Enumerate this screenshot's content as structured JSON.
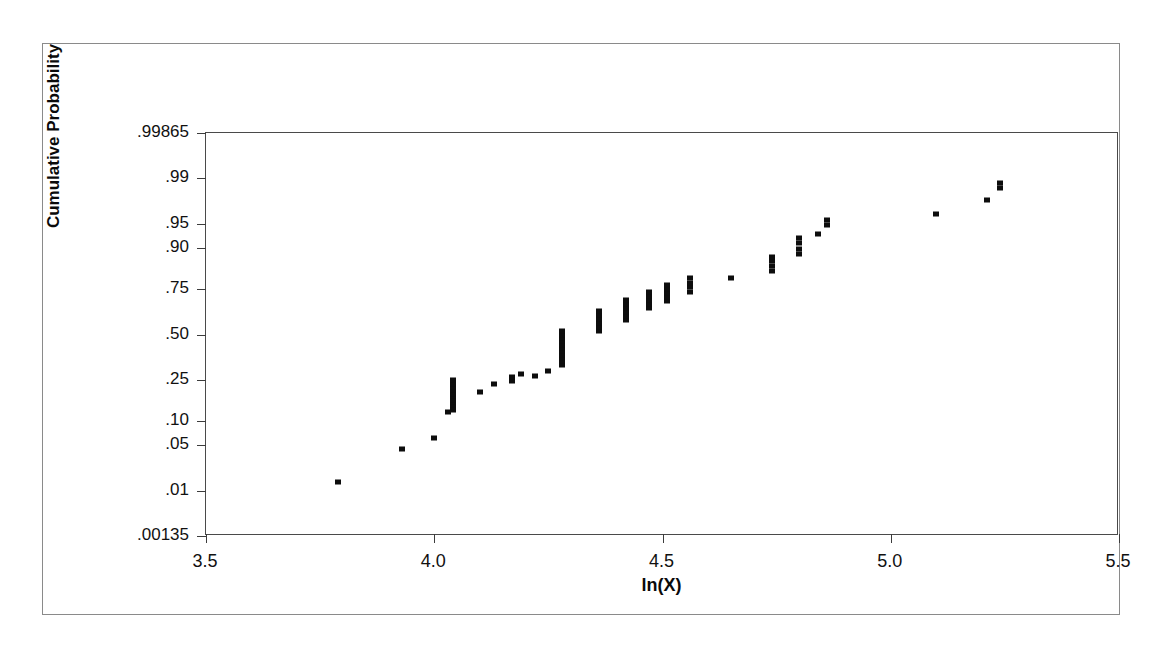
{
  "chart_data": {
    "type": "scatter",
    "title": "",
    "subtitle": "",
    "xlabel": "ln(X)",
    "ylabel": "Cumulative Probability",
    "plot_kind": "normal-probability-plot",
    "grid": false,
    "legend": null,
    "xlim": [
      3.5,
      5.5
    ],
    "xticks": [
      "3.5",
      "4.0",
      "4.5",
      "5.0",
      "5.5"
    ],
    "xtick_values": [
      3.5,
      4.0,
      4.5,
      5.0,
      5.5
    ],
    "ylim_probability": [
      0.00135,
      0.99865
    ],
    "ylim_z": [
      -3,
      3
    ],
    "yticks": [
      ".99865",
      ".99",
      ".95",
      ".90",
      ".75",
      ".50",
      ".25",
      ".10",
      ".05",
      ".01",
      ".00135"
    ],
    "ytick_values": [
      0.99865,
      0.99,
      0.95,
      0.9,
      0.75,
      0.5,
      0.25,
      0.1,
      0.05,
      0.01,
      0.00135
    ],
    "ytick_z": [
      3.0,
      2.326,
      1.645,
      1.282,
      0.674,
      0.0,
      -0.674,
      -1.282,
      -1.645,
      -2.326,
      -3.0
    ],
    "marker": "square",
    "marker_color": "#0d0d0d",
    "point_count": 78,
    "points_xz": [
      [
        3.79,
        -2.19
      ],
      [
        3.93,
        -1.7
      ],
      [
        4.0,
        -1.54
      ],
      [
        4.03,
        -1.16
      ],
      [
        4.04,
        -1.13
      ],
      [
        4.04,
        -1.09
      ],
      [
        4.04,
        -1.05
      ],
      [
        4.04,
        -1.01
      ],
      [
        4.04,
        -0.97
      ],
      [
        4.04,
        -0.92
      ],
      [
        4.04,
        -0.88
      ],
      [
        4.04,
        -0.83
      ],
      [
        4.04,
        -0.78
      ],
      [
        4.04,
        -0.73
      ],
      [
        4.04,
        -0.68
      ],
      [
        4.1,
        -0.85
      ],
      [
        4.13,
        -0.74
      ],
      [
        4.17,
        -0.69
      ],
      [
        4.17,
        -0.64
      ],
      [
        4.19,
        -0.59
      ],
      [
        4.22,
        -0.62
      ],
      [
        4.25,
        -0.55
      ],
      [
        4.28,
        -0.45
      ],
      [
        4.28,
        -0.4
      ],
      [
        4.28,
        -0.35
      ],
      [
        4.28,
        -0.3
      ],
      [
        4.28,
        -0.25
      ],
      [
        4.28,
        -0.2
      ],
      [
        4.28,
        -0.15
      ],
      [
        4.28,
        -0.1
      ],
      [
        4.28,
        -0.05
      ],
      [
        4.28,
        0.0
      ],
      [
        4.28,
        0.05
      ],
      [
        4.36,
        0.05
      ],
      [
        4.36,
        0.11
      ],
      [
        4.36,
        0.17
      ],
      [
        4.36,
        0.23
      ],
      [
        4.36,
        0.29
      ],
      [
        4.36,
        0.35
      ],
      [
        4.42,
        0.22
      ],
      [
        4.42,
        0.28
      ],
      [
        4.42,
        0.34
      ],
      [
        4.42,
        0.4
      ],
      [
        4.42,
        0.46
      ],
      [
        4.42,
        0.52
      ],
      [
        4.47,
        0.4
      ],
      [
        4.47,
        0.46
      ],
      [
        4.47,
        0.52
      ],
      [
        4.47,
        0.58
      ],
      [
        4.47,
        0.64
      ],
      [
        4.51,
        0.5
      ],
      [
        4.51,
        0.56
      ],
      [
        4.51,
        0.62
      ],
      [
        4.51,
        0.68
      ],
      [
        4.51,
        0.74
      ],
      [
        4.56,
        0.63
      ],
      [
        4.56,
        0.7
      ],
      [
        4.56,
        0.77
      ],
      [
        4.56,
        0.84
      ],
      [
        4.65,
        0.84
      ],
      [
        4.74,
        0.95
      ],
      [
        4.74,
        1.02
      ],
      [
        4.74,
        1.09
      ],
      [
        4.74,
        1.16
      ],
      [
        4.8,
        1.2
      ],
      [
        4.8,
        1.28
      ],
      [
        4.8,
        1.36
      ],
      [
        4.8,
        1.44
      ],
      [
        4.84,
        1.5
      ],
      [
        4.86,
        1.63
      ],
      [
        4.86,
        1.71
      ],
      [
        5.1,
        1.8
      ],
      [
        5.21,
        2.0
      ],
      [
        5.24,
        2.18
      ],
      [
        5.24,
        2.25
      ]
    ]
  },
  "axes": {
    "x_title": "ln(X)",
    "y_title": "Cumulative Probability"
  }
}
